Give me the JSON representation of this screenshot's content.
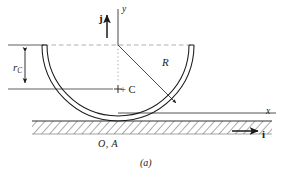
{
  "figure": {
    "caption": "(a)",
    "type": "mechanics-free-body-diagram"
  },
  "labels": {
    "radius": "R",
    "center_of_mass_distance_r": "r",
    "center_of_mass_distance_sub": "C",
    "center_point": "+ C",
    "axis_y": "y",
    "axis_x": "x",
    "unit_vector_j": "j",
    "unit_vector_i": "i",
    "contact_point": "O, A"
  },
  "colors": {
    "stroke": "#1a1a1a",
    "background": "#ffffff",
    "hatch": "#3a3a3a",
    "dashed": "#8a8a8a"
  },
  "geometry": {
    "origin_x": 118,
    "origin_y": 45,
    "outer_radius": 76,
    "inner_radius": 71,
    "ground_y": 121,
    "rim_y": 45
  }
}
